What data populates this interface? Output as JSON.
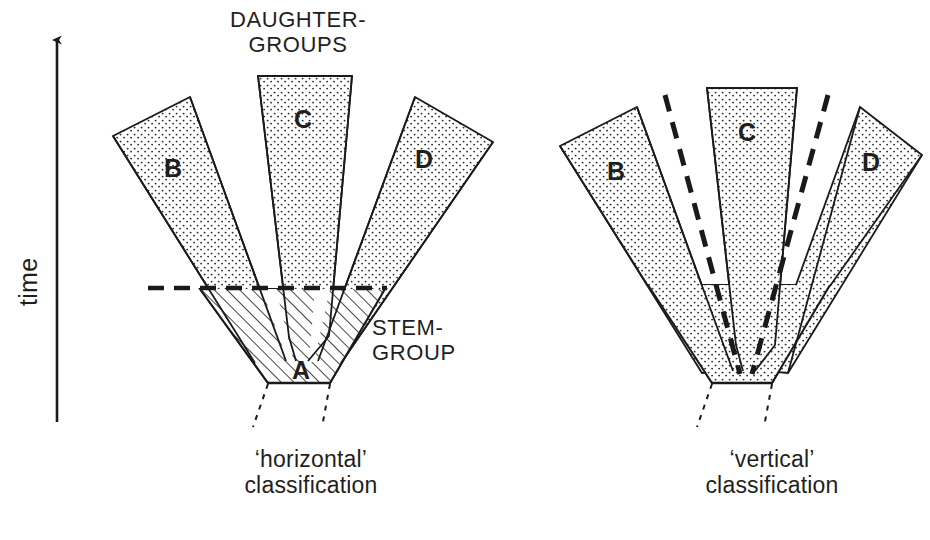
{
  "figure": {
    "type": "phylogenetic-classification-diagram",
    "axis": {
      "label": "time",
      "direction": "upward-arrow"
    },
    "header_label": {
      "line1": "DAUGHTER-",
      "line2": "GROUPS"
    },
    "stem_label": {
      "line1": "STEM-",
      "line2": "GROUP"
    },
    "panels": [
      {
        "id": "left",
        "caption_line1": "‘horizontal’",
        "caption_line2": "classification",
        "stem_fill": "hatched",
        "has_horizontal_dashed_line": true,
        "dashed_lines": 1,
        "branches": [
          {
            "id": "A",
            "label": "A",
            "role": "stem-group",
            "fill": "hatched"
          },
          {
            "id": "B",
            "label": "B",
            "role": "daughter-group",
            "fill": "stippled"
          },
          {
            "id": "C",
            "label": "C",
            "role": "daughter-group",
            "fill": "stippled"
          },
          {
            "id": "D",
            "label": "D",
            "role": "daughter-group",
            "fill": "stippled"
          }
        ]
      },
      {
        "id": "right",
        "caption_line1": "‘vertical’",
        "caption_line2": "classification",
        "stem_fill": "stippled",
        "has_horizontal_dashed_line": false,
        "dashed_lines": 2,
        "branches": [
          {
            "id": "B",
            "label": "B",
            "role": "daughter-group",
            "fill": "stippled"
          },
          {
            "id": "C",
            "label": "C",
            "role": "daughter-group",
            "fill": "stippled"
          },
          {
            "id": "D",
            "label": "D",
            "role": "daughter-group",
            "fill": "stippled"
          }
        ]
      }
    ],
    "colors": {
      "background": "#ffffff",
      "ink": "#1a1a1a",
      "stipple": "#2b2b2b",
      "hatch": "#262626"
    }
  }
}
